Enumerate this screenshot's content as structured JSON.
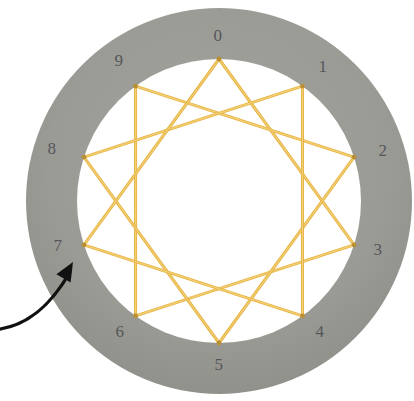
{
  "figure": {
    "type": "string-art-diagram",
    "board": {
      "shape": "annulus",
      "center_x": 219,
      "center_y": 201,
      "inner_radius": 142,
      "outer_radius": 193,
      "ring_color": "#9b9b96",
      "ring_edge_color": "#8e8e89",
      "interior_color": "#ffffff",
      "background_color": "#ffffff"
    },
    "thread": {
      "color": "#e7b64a",
      "highlight_color": "#f2cf72",
      "width": 3.1,
      "node_dot_color": "#b98f33"
    },
    "nodes": [
      {
        "id": "0",
        "label": "0",
        "angle_deg": -90,
        "label_x": 218,
        "label_y": 35
      },
      {
        "id": "1",
        "label": "1",
        "angle_deg": -54,
        "label_x": 323,
        "label_y": 66
      },
      {
        "id": "2",
        "label": "2",
        "angle_deg": -18,
        "label_x": 383,
        "label_y": 150
      },
      {
        "id": "3",
        "label": "3",
        "angle_deg": 18,
        "label_x": 378,
        "label_y": 249
      },
      {
        "id": "4",
        "label": "4",
        "angle_deg": 54,
        "label_x": 320,
        "label_y": 331
      },
      {
        "id": "5",
        "label": "5",
        "angle_deg": 90,
        "label_x": 219,
        "label_y": 364
      },
      {
        "id": "6",
        "label": "6",
        "angle_deg": 126,
        "label_x": 120,
        "label_y": 331
      },
      {
        "id": "7",
        "label": "7",
        "angle_deg": 162,
        "label_x": 58,
        "label_y": 245
      },
      {
        "id": "8",
        "label": "8",
        "angle_deg": 198,
        "label_x": 52,
        "label_y": 148
      },
      {
        "id": "9",
        "label": "9",
        "angle_deg": 234,
        "label_x": 119,
        "label_y": 60
      }
    ],
    "label_color": "#55565a",
    "label_font_size": 17,
    "pattern": {
      "name": "{10/3} decagram",
      "point_count": 10,
      "step": 3,
      "sequence": [
        "0",
        "3",
        "6",
        "9",
        "2",
        "5",
        "8",
        "1",
        "4",
        "7",
        "0"
      ],
      "edges": [
        [
          "0",
          "3"
        ],
        [
          "3",
          "6"
        ],
        [
          "6",
          "9"
        ],
        [
          "9",
          "2"
        ],
        [
          "2",
          "5"
        ],
        [
          "5",
          "8"
        ],
        [
          "8",
          "1"
        ],
        [
          "1",
          "4"
        ],
        [
          "4",
          "7"
        ],
        [
          "7",
          "0"
        ]
      ]
    },
    "annotation": {
      "type": "arrow",
      "name": "pointer-arrow",
      "color": "#111111",
      "target_node": "7",
      "path": "M -12 330 C 22 330, 48 310, 70 272",
      "tip_x": 73,
      "tip_y": 262,
      "stroke_width": 3.4
    }
  }
}
